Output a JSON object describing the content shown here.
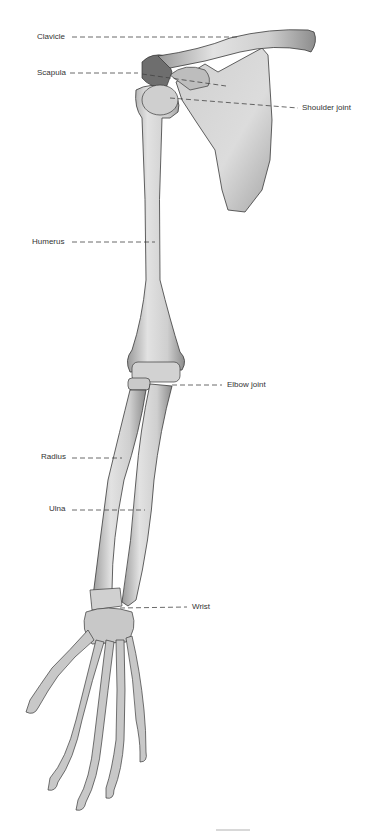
{
  "diagram": {
    "labels": [
      {
        "id": "clavicle",
        "text": "Clavicle",
        "x": 37,
        "y": 32,
        "side": "left",
        "target": [
          240,
          37
        ]
      },
      {
        "id": "scapula",
        "text": "Scapula",
        "x": 37,
        "y": 68,
        "side": "left",
        "target": [
          138,
          73
        ]
      },
      {
        "id": "shoulder-joint",
        "text": "Shoulder joint",
        "x": 302,
        "y": 103,
        "side": "right",
        "target": [
          170,
          98
        ]
      },
      {
        "id": "humerus",
        "text": "Humerus",
        "x": 32,
        "y": 237,
        "side": "left",
        "target": [
          155,
          242
        ]
      },
      {
        "id": "elbow-joint",
        "text": "Elbow joint",
        "x": 227,
        "y": 380,
        "side": "right",
        "target": [
          172,
          385
        ]
      },
      {
        "id": "radius",
        "text": "Radius",
        "x": 41,
        "y": 452,
        "side": "left",
        "target": [
          122,
          458
        ]
      },
      {
        "id": "ulna",
        "text": "Ulna",
        "x": 49,
        "y": 504,
        "side": "left",
        "target": [
          145,
          510
        ]
      },
      {
        "id": "wrist",
        "text": "Wrist",
        "x": 192,
        "y": 602,
        "side": "right",
        "target": [
          120,
          608
        ]
      }
    ],
    "colors": {
      "bone": "#d9d9d9",
      "bone_shadow": "#8a8a8a",
      "outline": "#3a3a3a",
      "label_text": "#333333",
      "leader_line": "#444444",
      "background": "#ffffff"
    }
  }
}
